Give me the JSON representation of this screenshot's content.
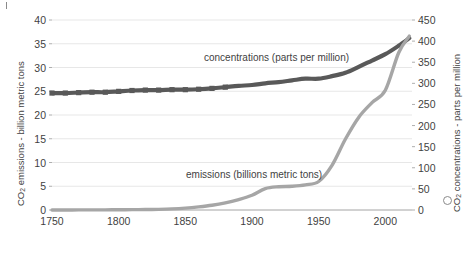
{
  "chart_data": {
    "type": "line",
    "title": "",
    "xlabel": "",
    "ylabel_left": "CO2 emissions - billion metric tons",
    "ylabel_right": "CO2 concentrations - parts per million",
    "grid": true,
    "legend_position": "inline-annotations",
    "xlim": [
      1750,
      2020
    ],
    "xticks": [
      "1750",
      "1800",
      "1850",
      "1900",
      "1950",
      "2000"
    ],
    "xtick_values": [
      1750,
      1800,
      1850,
      1900,
      1950,
      2000
    ],
    "ylim_left": [
      0,
      40
    ],
    "yticks_left": [
      "0",
      "5",
      "10",
      "15",
      "20",
      "25",
      "30",
      "35",
      "40"
    ],
    "ytick_values_left": [
      0,
      5,
      10,
      15,
      20,
      25,
      30,
      35,
      40
    ],
    "ylim_right": [
      0,
      450
    ],
    "yticks_right": [
      "0",
      "50",
      "100",
      "150",
      "200",
      "250",
      "300",
      "350",
      "400",
      "450"
    ],
    "ytick_values_right": [
      0,
      50,
      100,
      150,
      200,
      250,
      300,
      350,
      400,
      450
    ],
    "series": [
      {
        "name": "concentrations (parts per million)",
        "axis": "right",
        "color": "#595959",
        "style": "thick-line-with-square-markers",
        "annotation": "concentrations (parts per million)",
        "x": [
          1750,
          1760,
          1770,
          1780,
          1790,
          1800,
          1810,
          1820,
          1830,
          1840,
          1850,
          1860,
          1870,
          1880,
          1890,
          1900,
          1910,
          1920,
          1930,
          1940,
          1950,
          1960,
          1970,
          1980,
          1990,
          2000,
          2010,
          2018
        ],
        "values": [
          277,
          277,
          278,
          279,
          279,
          281,
          283,
          284,
          284,
          285,
          285,
          286,
          288,
          291,
          294,
          296,
          300,
          303,
          307,
          311,
          311,
          317,
          325,
          339,
          354,
          369,
          389,
          407
        ]
      },
      {
        "name": "emissions (billions metric tons)",
        "axis": "left",
        "color": "#a6a6a6",
        "style": "thick-line",
        "annotation": "emissions (billions metric tons)",
        "x": [
          1750,
          1760,
          1770,
          1780,
          1790,
          1800,
          1810,
          1820,
          1830,
          1840,
          1850,
          1860,
          1870,
          1880,
          1890,
          1900,
          1910,
          1920,
          1930,
          1940,
          1950,
          1960,
          1970,
          1980,
          1990,
          2000,
          2010,
          2018
        ],
        "values": [
          0.01,
          0.01,
          0.02,
          0.03,
          0.03,
          0.05,
          0.07,
          0.1,
          0.14,
          0.23,
          0.4,
          0.66,
          1.0,
          1.5,
          2.2,
          3.1,
          4.5,
          4.9,
          5.0,
          5.3,
          6.0,
          9.4,
          14.9,
          19.5,
          22.6,
          25.2,
          33.1,
          36.6
        ]
      }
    ]
  },
  "plot": {
    "left": 52,
    "right": 412,
    "top": 20,
    "bottom": 210
  }
}
